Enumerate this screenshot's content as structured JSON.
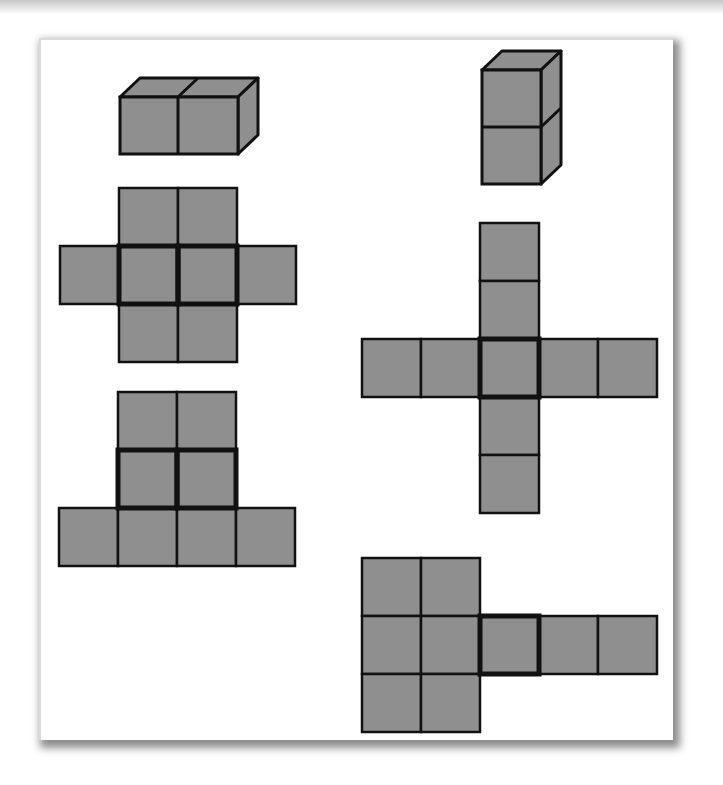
{
  "figure": {
    "colors": {
      "face_fill": "#8f8f8f",
      "edge": "#111111",
      "background": "#ffffff",
      "shadow": "#777777"
    },
    "unit_px": 59,
    "solids": [
      {
        "id": "horizontal-cuboid",
        "cubes": 2,
        "orientation": "horizontal",
        "front": {
          "x": 120,
          "y": 97
        }
      },
      {
        "id": "vertical-cuboid",
        "cubes": 2,
        "orientation": "vertical",
        "front": {
          "x": 482,
          "y": 70
        }
      }
    ],
    "nets": [
      {
        "id": "net-1",
        "origin": {
          "x": 60,
          "y": 188
        },
        "cells": [
          [
            1,
            0
          ],
          [
            2,
            0
          ],
          [
            0,
            1
          ],
          [
            1,
            1
          ],
          [
            2,
            1
          ],
          [
            3,
            1
          ],
          [
            1,
            2
          ],
          [
            2,
            2
          ]
        ],
        "highlight": [
          [
            1,
            1
          ],
          [
            2,
            1
          ]
        ]
      },
      {
        "id": "net-2",
        "origin": {
          "x": 59,
          "y": 392
        },
        "cells": [
          [
            1,
            0
          ],
          [
            2,
            0
          ],
          [
            1,
            1
          ],
          [
            2,
            1
          ],
          [
            0,
            2
          ],
          [
            1,
            2
          ],
          [
            2,
            2
          ],
          [
            3,
            2
          ]
        ],
        "highlight": [
          [
            1,
            1
          ],
          [
            2,
            1
          ]
        ]
      },
      {
        "id": "net-3",
        "origin": {
          "x": 362,
          "y": 223
        },
        "cells": [
          [
            2,
            0
          ],
          [
            2,
            1
          ],
          [
            0,
            2
          ],
          [
            1,
            2
          ],
          [
            2,
            2
          ],
          [
            3,
            2
          ],
          [
            4,
            2
          ],
          [
            2,
            3
          ],
          [
            2,
            4
          ]
        ],
        "highlight": [
          [
            2,
            2
          ]
        ]
      },
      {
        "id": "net-4",
        "origin": {
          "x": 362,
          "y": 558
        },
        "cells": [
          [
            0,
            0
          ],
          [
            1,
            0
          ],
          [
            0,
            1
          ],
          [
            1,
            1
          ],
          [
            2,
            1
          ],
          [
            3,
            1
          ],
          [
            4,
            1
          ],
          [
            0,
            2
          ],
          [
            1,
            2
          ]
        ],
        "highlight": [
          [
            2,
            1
          ]
        ]
      }
    ]
  }
}
